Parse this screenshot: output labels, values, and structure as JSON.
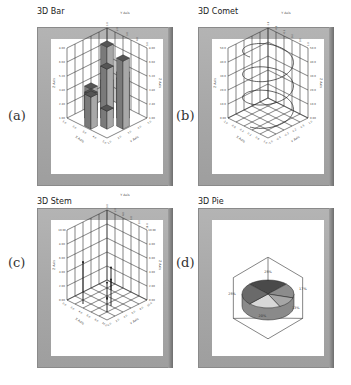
{
  "figure": {
    "panels": [
      {
        "id": "a",
        "label": "(a)",
        "title": "3D Bar"
      },
      {
        "id": "b",
        "label": "(b)",
        "title": "3D Comet"
      },
      {
        "id": "c",
        "label": "(c)",
        "title": "3D Stem"
      },
      {
        "id": "d",
        "label": "(d)",
        "title": "3D Pie"
      }
    ]
  },
  "chart_data": [
    {
      "type": "bar",
      "subtype": "3d-bar",
      "title": "3D Bar",
      "xlabel": "X Axis",
      "ylabel": "Y Axis",
      "zlabel": "Z Axis",
      "x_ticks": [
        "1.0",
        "2.0",
        "3.0",
        "4.0",
        "5.0"
      ],
      "y_ticks": [
        "1.0",
        "2.0",
        "3.0",
        "4.0",
        "5.0"
      ],
      "z_ticks": [
        "1.00",
        "2.40",
        "3.80",
        "5.20",
        "6.60",
        "8.00"
      ],
      "grid": true,
      "series": [
        {
          "name": "bars",
          "points": [
            {
              "x": 1,
              "y": 1,
              "z": 3.2
            },
            {
              "x": 1,
              "y": 3,
              "z": 4.8
            },
            {
              "x": 2,
              "y": 2,
              "z": 7.6
            },
            {
              "x": 2,
              "y": 4,
              "z": 5.0
            },
            {
              "x": 3,
              "y": 1,
              "z": 3.4
            },
            {
              "x": 3,
              "y": 3,
              "z": 6.2
            },
            {
              "x": 3,
              "y": 5,
              "z": 7.8
            },
            {
              "x": 4,
              "y": 2,
              "z": 3.6
            },
            {
              "x": 4,
              "y": 4,
              "z": 2.8
            },
            {
              "x": 5,
              "y": 3,
              "z": 4.2
            }
          ]
        }
      ]
    },
    {
      "type": "line",
      "subtype": "3d-comet",
      "title": "3D Comet",
      "xlabel": "X Axis",
      "ylabel": "Y Axis",
      "zlabel": "Z Axis",
      "x_ticks": [
        "-1.0",
        "-0.6",
        "-0.2",
        "0.2",
        "0.6",
        "1.0"
      ],
      "y_ticks": [
        "-1.0",
        "-0.6",
        "-0.2",
        "0.2",
        "0.6",
        "1.0"
      ],
      "z_ticks": [
        "0.00",
        "10.0",
        "20.0",
        "30.0",
        "40.0",
        "50.0"
      ],
      "grid": true,
      "series": [
        {
          "name": "helix",
          "description": "circular helix, x=cos(t), y=sin(t), z=t",
          "turns": 3
        }
      ]
    },
    {
      "type": "scatter",
      "subtype": "3d-stem",
      "title": "3D Stem",
      "xlabel": "X Axis",
      "ylabel": "Y Axis",
      "zlabel": "Z Axis",
      "x_ticks": [
        "0.0",
        "2.0",
        "4.0",
        "6.0",
        "8.0",
        "10.0"
      ],
      "y_ticks": [
        "0.0",
        "2.0",
        "4.0",
        "6.0",
        "8.0",
        "10.0"
      ],
      "z_ticks": [
        "0.00",
        "2.00",
        "4.00",
        "6.00",
        "8.00",
        "10.00"
      ],
      "grid": true,
      "series": [
        {
          "name": "stems",
          "points": [
            {
              "x": 2,
              "y": 3,
              "z": 1.5
            },
            {
              "x": 5,
              "y": 5,
              "z": 2.5
            },
            {
              "x": 6,
              "y": 7,
              "z": 5.5
            },
            {
              "x": 8,
              "y": 8,
              "z": 2.0
            },
            {
              "x": 9,
              "y": 3,
              "z": 6.0
            }
          ]
        }
      ]
    },
    {
      "type": "pie",
      "subtype": "3d-pie",
      "title": "3D Pie",
      "slices": [
        {
          "label": "25%",
          "value": 25,
          "color": "#4a4a4a"
        },
        {
          "label": "17%",
          "value": 17,
          "color": "#8c8c8c"
        },
        {
          "label": "13%",
          "value": 13,
          "color": "#a6a6a6"
        },
        {
          "label": "20%",
          "value": 20,
          "color": "#d8d8d8"
        },
        {
          "label": "25%",
          "value": 25,
          "color": "#6a6a6a"
        }
      ]
    }
  ]
}
